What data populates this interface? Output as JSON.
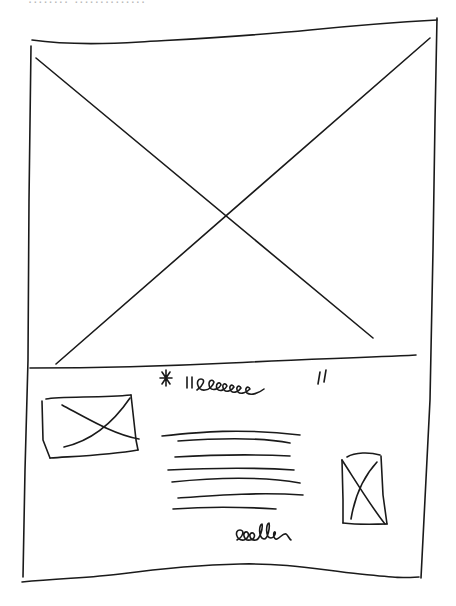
{
  "sketch": {
    "type": "hand-drawn wireframe",
    "top_clipped_text": "........ ..............",
    "hero": {
      "kind": "image-placeholder",
      "marker": "X"
    },
    "content": {
      "quote": {
        "prefix": "*",
        "text": "\"eeeeee\"",
        "kind": "scribbled quote/title"
      },
      "thumbnail_left": {
        "kind": "image-placeholder",
        "marker": "X"
      },
      "text_lines": 7,
      "thumbnail_right": {
        "kind": "image-placeholder",
        "marker": "X"
      },
      "signature": {
        "text": "eeeee",
        "kind": "scribbled author/caption"
      }
    },
    "stroke_color": "#1a1a1a",
    "background": "#ffffff"
  }
}
